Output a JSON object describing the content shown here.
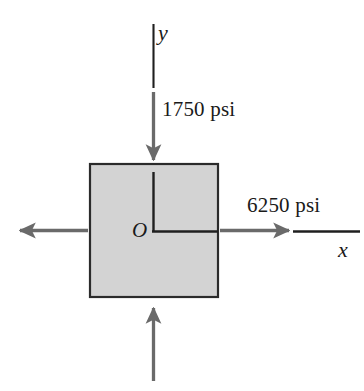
{
  "figure": {
    "background_color": "#ffffff",
    "element": {
      "name": "stress-element-square",
      "fill_color": "#d3d3d3",
      "stroke_color": "#2b2b2b",
      "x": 89,
      "y": 163,
      "width": 129,
      "height": 134
    },
    "origin": {
      "label": "O",
      "x": 152,
      "y": 231
    },
    "axes": [
      {
        "name": "y-axis",
        "label": "y",
        "orientation": "vertical",
        "color": "#1f1f1f"
      },
      {
        "name": "x-axis",
        "label": "x",
        "orientation": "horizontal",
        "color": "#1f1f1f"
      }
    ],
    "stresses": [
      {
        "name": "vertical-compressive-stress",
        "label": "1750 psi",
        "value": 1750,
        "unit": "psi",
        "direction": "vertical",
        "sense": "compression",
        "arrow_color": "#6a6a6a"
      },
      {
        "name": "horizontal-tensile-stress",
        "label": "6250 psi",
        "value": 6250,
        "unit": "psi",
        "direction": "horizontal",
        "sense": "tension",
        "arrow_color": "#6a6a6a"
      }
    ],
    "arrows": [
      {
        "name": "top-down-arrow",
        "points": "down",
        "from_y": 92,
        "to_y": 162
      },
      {
        "name": "bottom-up-arrow",
        "points": "up",
        "from_y": 381,
        "to_y": 306
      },
      {
        "name": "left-out-arrow",
        "points": "left",
        "from_x": 88,
        "to_x": 18
      },
      {
        "name": "right-out-arrow",
        "points": "right",
        "from_x": 220,
        "to_x": 291
      }
    ]
  }
}
